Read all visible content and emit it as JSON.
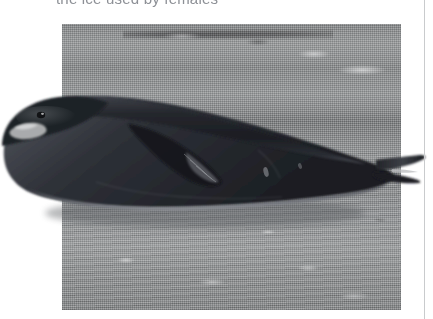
{
  "page": {
    "background_color": "#ffffff",
    "width": 433,
    "height": 319
  },
  "caption": {
    "text": "the ice used by females",
    "color": "#8d9096",
    "clipped_by_page_top": true
  },
  "page_rule": {
    "name": "vertical-page-rule",
    "color": "#c9cbcd"
  },
  "photo": {
    "title": "Weddell seal resting on sea ice",
    "kind": "grayscale-halftone-photograph",
    "frame": {
      "left": 62,
      "top": 24,
      "width": 339,
      "height": 286
    },
    "background_color": "#8e9093",
    "subject": {
      "name": "seal",
      "body_color": "#22242a",
      "belly_color": "#4a4d54",
      "highlight_color": "#d8d9da",
      "pose": "lying on side, head to the left, tail flipper to the right",
      "bleeds_past_left_edge": true,
      "bleeds_past_right_edge": true
    },
    "scene": {
      "ground": "snow and sea ice",
      "ground_color": "#9a9c9d",
      "horizon_band_color": "#787a7b",
      "foreground_texture": "wind-scoured ice streaks"
    }
  }
}
